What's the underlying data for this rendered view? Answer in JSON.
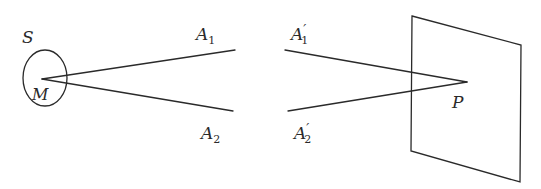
{
  "diagram": {
    "stroke_color": "#2a2a2a",
    "labels": {
      "S": {
        "text": "S"
      },
      "M": {
        "text": "M"
      },
      "A1": {
        "base": "A",
        "sub": "1",
        "prime": ""
      },
      "A2": {
        "base": "A",
        "sub": "2",
        "prime": ""
      },
      "A1p": {
        "base": "A",
        "sub": "1",
        "prime": "′"
      },
      "A2p": {
        "base": "A",
        "sub": "2",
        "prime": "′"
      },
      "P": {
        "text": "P"
      }
    }
  }
}
